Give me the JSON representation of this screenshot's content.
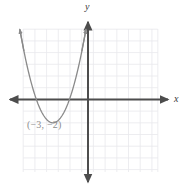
{
  "figure": {
    "name": "parabola-graph",
    "background_color": "#ffffff"
  },
  "axes": {
    "x_label": "x",
    "y_label": "y",
    "axis_color": "#4d4d4d",
    "grid_color": "#e8e8ec",
    "grid_on": true
  },
  "annotations": {
    "vertex_label": "(−3, −2)",
    "vertex_label_color": "#8d8d8d"
  },
  "chart_data": {
    "type": "line",
    "title": "",
    "xlabel": "x",
    "ylabel": "y",
    "xlim": [
      -5.6,
      6.0
    ],
    "ylim": [
      -6.1,
      6.1
    ],
    "grid": true,
    "grid_step": 1,
    "legend": "none",
    "curve_color": "#8a8a8a",
    "series": [
      {
        "name": "parabola",
        "equation": "y = (x + 3)^2 - 2",
        "vertex": [
          -3,
          -2
        ],
        "opens": "up",
        "a": 1,
        "roots": [
          -4.414,
          -1.586
        ],
        "x": [
          -5.4,
          -5.0,
          -4.6,
          -4.2,
          -3.8,
          -3.4,
          -3.0,
          -2.6,
          -2.2,
          -1.8,
          -1.4,
          -1.0,
          -0.6,
          -0.2
        ],
        "y": [
          3.76,
          2.0,
          0.56,
          -0.56,
          -1.36,
          -1.84,
          -2.0,
          -1.84,
          -1.36,
          -0.56,
          0.56,
          2.0,
          3.76,
          5.84
        ]
      }
    ],
    "annotations": [
      {
        "text": "(−3, −2)",
        "x": -3,
        "y": -2.9
      }
    ]
  }
}
